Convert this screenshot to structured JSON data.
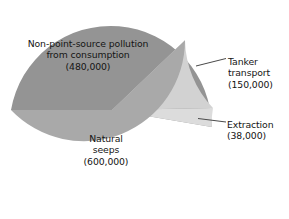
{
  "chart_data": {
    "type": "pie",
    "title": "",
    "subtitle": "",
    "xlabel": "",
    "ylabel": "",
    "legend_position": "none",
    "grid": false,
    "units": "tonnes per year",
    "total": 1268000,
    "start_angle_deg": 180,
    "direction": "clockwise",
    "categories": [
      "Non-point-source pollution from consumption",
      "Tanker transport",
      "Extraction",
      "Natural seeps"
    ],
    "values": [
      480000,
      150000,
      38000,
      600000
    ],
    "value_labels": [
      "(480,000)",
      "(150,000)",
      "(38,000)",
      "(600,000)"
    ],
    "colors": [
      "#a9a9a9",
      "#d2d2d2",
      "#dcdcdc",
      "#949494"
    ],
    "slices": [
      {
        "name": "Non-point-source pollution from consumption",
        "value": 480000,
        "value_label": "(480,000)",
        "percent": 37.9,
        "angle_deg": 136.3,
        "color": "#a9a9a9",
        "label_placement": "inside",
        "label_lines": [
          "Non-point-source pollution",
          "from consumption",
          "(480,000)"
        ]
      },
      {
        "name": "Tanker transport",
        "value": 150000,
        "value_label": "(150,000)",
        "percent": 11.8,
        "angle_deg": 42.6,
        "color": "#d2d2d2",
        "label_placement": "callout-right",
        "label_lines": [
          "Tanker",
          "transport",
          "(150,000)"
        ]
      },
      {
        "name": "Extraction",
        "value": 38000,
        "value_label": "(38,000)",
        "percent": 3.0,
        "angle_deg": 10.8,
        "color": "#dcdcdc",
        "label_placement": "callout-right",
        "label_lines": [
          "Extraction",
          "(38,000)"
        ]
      },
      {
        "name": "Natural seeps",
        "value": 600000,
        "value_label": "(600,000)",
        "percent": 47.3,
        "angle_deg": 170.3,
        "color": "#949494",
        "label_placement": "inside",
        "label_lines": [
          "Natural",
          "seeps",
          "(600,000)"
        ]
      }
    ]
  },
  "labels": {
    "nonpoint": {
      "line1": "Non-point-source pollution",
      "line2": "from consumption",
      "line3": "(480,000)"
    },
    "natural": {
      "line1": "Natural",
      "line2": "seeps",
      "line3": "(600,000)"
    },
    "tanker": {
      "line1": "Tanker",
      "line2": "transport",
      "line3": "(150,000)"
    },
    "extraction": {
      "line1": "Extraction",
      "line2": "(38,000)"
    }
  },
  "style": {
    "background": "#ffffff",
    "text_color": "#141414",
    "leader_line_color": "#4a4a4a"
  }
}
